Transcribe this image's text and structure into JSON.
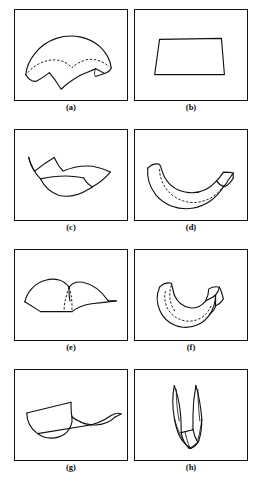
{
  "figure": {
    "title": "",
    "background_color": "#ffffff",
    "ink_color": "#111111",
    "width": 262,
    "height": 494,
    "panel_count": 8,
    "layout": {
      "columns": 2,
      "rows": 4
    },
    "panels": [
      {
        "id": "a",
        "caption": "(a)",
        "shape_name": "saddle-dome-patch-with-dashed-fold-curve",
        "description": "Curved surface patch, dome-like upper boundary with a cusped lower boundary and an interior dashed crease curve",
        "has_dashed_curve": true,
        "frame": {
          "x": 14,
          "y": 9,
          "w": 114,
          "h": 92
        }
      },
      {
        "id": "b",
        "caption": "(b)",
        "shape_name": "planar-quadrilateral-patch",
        "description": "Flat trapezoidal quadrilateral outline",
        "has_dashed_curve": false,
        "frame": {
          "x": 134,
          "y": 9,
          "w": 114,
          "h": 92
        }
      },
      {
        "id": "c",
        "caption": "(c)",
        "shape_name": "bowl-shaped-patch-with-cusps",
        "description": "Concave bowl-like surface patch with two cusp points on the upper boundary",
        "has_dashed_curve": false,
        "frame": {
          "x": 14,
          "y": 129,
          "w": 114,
          "h": 92
        }
      },
      {
        "id": "d",
        "caption": "(d)",
        "shape_name": "bent-band-patch-with-dashed-curve",
        "description": "U-shaped bent ribbon/band with an interior dashed curve along its length",
        "has_dashed_curve": true,
        "frame": {
          "x": 134,
          "y": 129,
          "w": 114,
          "h": 92
        }
      },
      {
        "id": "e",
        "caption": "(e)",
        "shape_name": "ridge-surface-patch-with-dashed-crease",
        "description": "Arched ridge-like surface seen in perspective with a dashed crease descending from the ridge",
        "has_dashed_curve": true,
        "frame": {
          "x": 14,
          "y": 249,
          "w": 114,
          "h": 92
        }
      },
      {
        "id": "f",
        "caption": "(f)",
        "shape_name": "folded-elbow-band-with-dashed-curve",
        "description": "Elbow-shaped folded band in perspective with dashed interior curve",
        "has_dashed_curve": true,
        "frame": {
          "x": 134,
          "y": 249,
          "w": 114,
          "h": 92
        }
      },
      {
        "id": "g",
        "caption": "(g)",
        "shape_name": "trough-surface-patch-with-dashed-edge",
        "description": "Trough / valley shaped surface patch in perspective with a dashed hidden edge",
        "has_dashed_curve": true,
        "frame": {
          "x": 14,
          "y": 369,
          "w": 114,
          "h": 92
        }
      },
      {
        "id": "h",
        "caption": "(h)",
        "shape_name": "narrow-pinched-vertical-fold",
        "description": "Narrow vertically oriented pinched fold / cusped sliver shape viewed edge-on",
        "has_dashed_curve": false,
        "frame": {
          "x": 134,
          "y": 369,
          "w": 114,
          "h": 92
        }
      }
    ],
    "captions": {
      "a": "(a)",
      "b": "(b)",
      "c": "(c)",
      "d": "(d)",
      "e": "(e)",
      "f": "(f)",
      "g": "(g)",
      "h": "(h)"
    }
  }
}
